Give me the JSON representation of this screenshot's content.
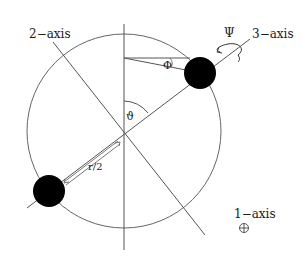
{
  "diagram": {
    "type": "rigid-rotor-euler-angles",
    "labels": {
      "axis1": "1−axis",
      "axis2": "2−axis",
      "axis3": "3−axis",
      "axis1_symbol": "⊕",
      "theta": "ϑ",
      "phi": "Φ",
      "psi": "Ψ",
      "half_distance": "r/2"
    },
    "colors": {
      "line": "#555555",
      "mass": "#000000",
      "text": "#1a1a1a",
      "background": "#ffffff"
    }
  }
}
